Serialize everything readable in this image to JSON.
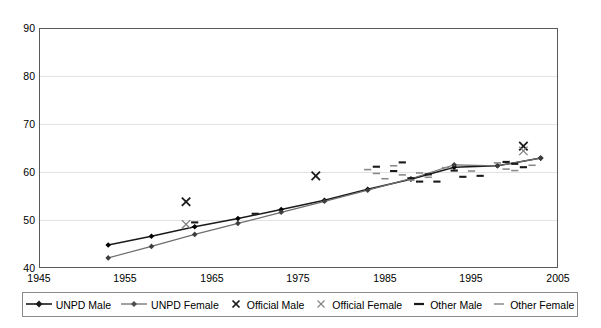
{
  "chart_data": {
    "type": "scatter",
    "title": "",
    "xlabel": "",
    "ylabel": "",
    "xlim": [
      1945,
      2005
    ],
    "ylim": [
      40,
      90
    ],
    "xticks": [
      1945,
      1955,
      1965,
      1975,
      1985,
      1995,
      2005
    ],
    "yticks": [
      40,
      50,
      60,
      70,
      80,
      90
    ],
    "grid": true,
    "legend_position": "bottom",
    "series": [
      {
        "name": "UNPD Male",
        "marker": "diamond",
        "style": "line-with-markers",
        "color": "#1a1a1a",
        "points": [
          {
            "x": 1953,
            "y": 44.8
          },
          {
            "x": 1958,
            "y": 46.6
          },
          {
            "x": 1963,
            "y": 48.6
          },
          {
            "x": 1968,
            "y": 50.3
          },
          {
            "x": 1973,
            "y": 52.2
          },
          {
            "x": 1978,
            "y": 54.1
          },
          {
            "x": 1983,
            "y": 56.4
          },
          {
            "x": 1988,
            "y": 58.5
          },
          {
            "x": 1993,
            "y": 61.0
          },
          {
            "x": 1998,
            "y": 61.3
          },
          {
            "x": 2003,
            "y": 62.9
          }
        ]
      },
      {
        "name": "UNPD Female",
        "marker": "diamond",
        "style": "line-with-markers",
        "color": "#6e6e6e",
        "points": [
          {
            "x": 1953,
            "y": 42.1
          },
          {
            "x": 1958,
            "y": 44.5
          },
          {
            "x": 1963,
            "y": 47.0
          },
          {
            "x": 1968,
            "y": 49.3
          },
          {
            "x": 1973,
            "y": 51.6
          },
          {
            "x": 1978,
            "y": 53.9
          },
          {
            "x": 1983,
            "y": 56.2
          },
          {
            "x": 1988,
            "y": 58.6
          },
          {
            "x": 1993,
            "y": 61.5
          },
          {
            "x": 1998,
            "y": 61.3
          },
          {
            "x": 2003,
            "y": 62.9
          }
        ]
      },
      {
        "name": "Official Male",
        "marker": "x",
        "style": "markers",
        "color": "#1a1a1a",
        "points": [
          {
            "x": 1962,
            "y": 53.8
          },
          {
            "x": 1977,
            "y": 59.2
          },
          {
            "x": 2001,
            "y": 65.4
          }
        ]
      },
      {
        "name": "Official Female",
        "marker": "x",
        "style": "markers",
        "color": "#7a7a7a",
        "points": [
          {
            "x": 1962,
            "y": 49.1
          },
          {
            "x": 2001,
            "y": 64.4
          }
        ]
      },
      {
        "name": "Other Male",
        "marker": "dash",
        "style": "markers",
        "color": "#1a1a1a",
        "points": [
          {
            "x": 1963,
            "y": 49.5
          },
          {
            "x": 1970,
            "y": 51.3
          },
          {
            "x": 1984,
            "y": 61.1
          },
          {
            "x": 1986,
            "y": 60.2
          },
          {
            "x": 1987,
            "y": 62.0
          },
          {
            "x": 1988,
            "y": 58.7
          },
          {
            "x": 1989,
            "y": 58.0
          },
          {
            "x": 1990,
            "y": 59.5
          },
          {
            "x": 1991,
            "y": 58.0
          },
          {
            "x": 1993,
            "y": 60.3
          },
          {
            "x": 1994,
            "y": 59.0
          },
          {
            "x": 1996,
            "y": 59.2
          },
          {
            "x": 1999,
            "y": 62.1
          },
          {
            "x": 2000,
            "y": 61.7
          },
          {
            "x": 2001,
            "y": 61.0
          }
        ]
      },
      {
        "name": "Other Female",
        "marker": "dash",
        "style": "markers",
        "color": "#8a8a8a",
        "points": [
          {
            "x": 1983,
            "y": 60.5
          },
          {
            "x": 1984,
            "y": 59.7
          },
          {
            "x": 1985,
            "y": 58.6
          },
          {
            "x": 1986,
            "y": 61.3
          },
          {
            "x": 1987,
            "y": 59.4
          },
          {
            "x": 1988,
            "y": 58.3
          },
          {
            "x": 1989,
            "y": 59.8
          },
          {
            "x": 1990,
            "y": 58.9
          },
          {
            "x": 1992,
            "y": 60.9
          },
          {
            "x": 1995,
            "y": 60.2
          },
          {
            "x": 1998,
            "y": 61.9
          },
          {
            "x": 1999,
            "y": 60.6
          },
          {
            "x": 2000,
            "y": 60.3
          },
          {
            "x": 2002,
            "y": 61.4
          }
        ]
      }
    ]
  },
  "axes": {
    "ytick_labels": [
      "90",
      "80",
      "70",
      "60",
      "50",
      "40"
    ],
    "xtick_labels": [
      "1945",
      "1955",
      "1965",
      "1975",
      "1985",
      "1995",
      "2005"
    ]
  },
  "legend": {
    "items": [
      {
        "label": "UNPD Male",
        "marker": "line-diamond-dark"
      },
      {
        "label": "UNPD Female",
        "marker": "line-diamond-gray"
      },
      {
        "label": "Official Male",
        "marker": "x-dark"
      },
      {
        "label": "Official Female",
        "marker": "x-gray"
      },
      {
        "label": "Other Male",
        "marker": "dash-dark"
      },
      {
        "label": "Other Female",
        "marker": "dash-gray"
      }
    ]
  },
  "colors": {
    "unpd_male": "#1a1a1a",
    "unpd_female": "#6e6e6e",
    "official_male": "#1a1a1a",
    "official_female": "#7a7a7a",
    "other_male": "#1a1a1a",
    "other_female": "#8a8a8a",
    "grid": "#e2e2e2",
    "frame": "#5a5a5a",
    "background": "#ffffff"
  }
}
